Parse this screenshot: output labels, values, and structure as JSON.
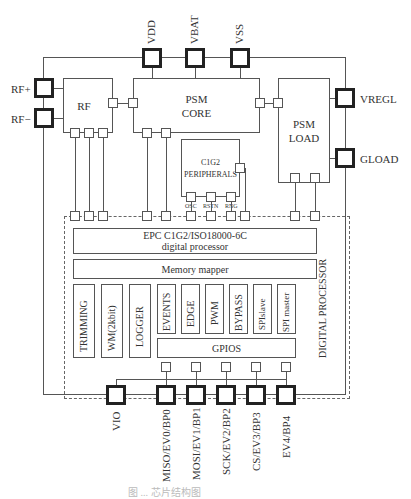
{
  "pins_top": [
    {
      "label": "VDD"
    },
    {
      "label": "VBAT"
    },
    {
      "label": "VSS"
    }
  ],
  "pins_left": [
    {
      "label": "RF+"
    },
    {
      "label": "RF−"
    }
  ],
  "pins_right": [
    {
      "label": "VREGL"
    },
    {
      "label": "GLOAD"
    }
  ],
  "pins_bottom": [
    {
      "label": "VIO"
    },
    {
      "label": "MISO/EV0/BP0"
    },
    {
      "label": "MOSI/EV1/BP1"
    },
    {
      "label": "SCK/EV2/BP2"
    },
    {
      "label": "CS/EV3/BP3"
    },
    {
      "label": "EV4/BP4"
    }
  ],
  "blocks": {
    "rf": {
      "label": "RF"
    },
    "psm_core": {
      "line1": "PSM",
      "line2": "CORE"
    },
    "psm_load": {
      "line1": "PSM",
      "line2": "LOAD"
    },
    "c1g2": {
      "line1": "C1G2",
      "line2": "PERIPHERALS",
      "ports": [
        "OSC",
        "RSTN",
        "RNG"
      ]
    }
  },
  "digital_processor": {
    "label": "DIGITAL PROCESSOR",
    "epc": {
      "line1": "EPC C1G2/ISO18000-6C",
      "line2": "digital processor"
    },
    "memory_mapper": "Memory mapper",
    "modules_left": [
      "TRIMMING",
      "WM(2kbit)",
      "LOGGER"
    ],
    "modules_right": [
      "EVENTS",
      "EDGE",
      "PWM",
      "BYPASS",
      "SPIslave",
      "SPI master"
    ],
    "gpios": "GPIOS"
  },
  "caption": "图 ...  芯片结构图"
}
